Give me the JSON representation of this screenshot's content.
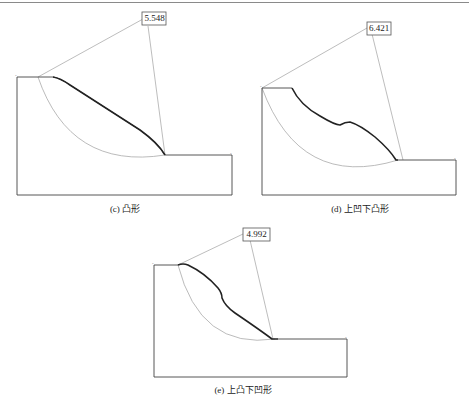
{
  "figures": [
    {
      "id": "c",
      "caption": "(c) 凸形",
      "factor_of_safety": "5.548",
      "profile": "convex"
    },
    {
      "id": "d",
      "caption": "(d) 上凹下凸形",
      "factor_of_safety": "6.421",
      "profile": "upper-concave lower-convex"
    },
    {
      "id": "e",
      "caption": "(e) 上凸下凹形",
      "factor_of_safety": "4.992",
      "profile": "upper-convex lower-concave"
    }
  ],
  "colors": {
    "slope_line": "#333333",
    "slip_arc": "#a8a8a8",
    "radius_line": "#9a9a9a",
    "box_border": "#444444"
  }
}
